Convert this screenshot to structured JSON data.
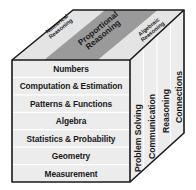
{
  "diagram": {
    "type": "cube",
    "top_face": {
      "bands": [
        {
          "label_line1": "Numerical",
          "label_line2": "Reasoning",
          "shade": "light"
        },
        {
          "label_line1": "Proportional",
          "label_line2": "Reasoning",
          "shade": "dark"
        },
        {
          "label_line1": "Algebraic",
          "label_line2": "Reasoning",
          "shade": "light"
        }
      ]
    },
    "front_face": {
      "rows": [
        "Numbers",
        "Computation & Estimation",
        "Patterns & Functions",
        "Algebra",
        "Statistics & Probability",
        "Geometry",
        "Measurement"
      ]
    },
    "right_face": {
      "columns": [
        "Problem Solving",
        "Communication",
        "Reasoning",
        "Connections"
      ]
    },
    "colors": {
      "outline": "#1a1a1a",
      "face_light": "#ececec",
      "band_light": "#e4e4e4",
      "band_dark": "#9a9a9a",
      "grid_line": "#ffffff",
      "text": "#1a1a1a"
    }
  }
}
